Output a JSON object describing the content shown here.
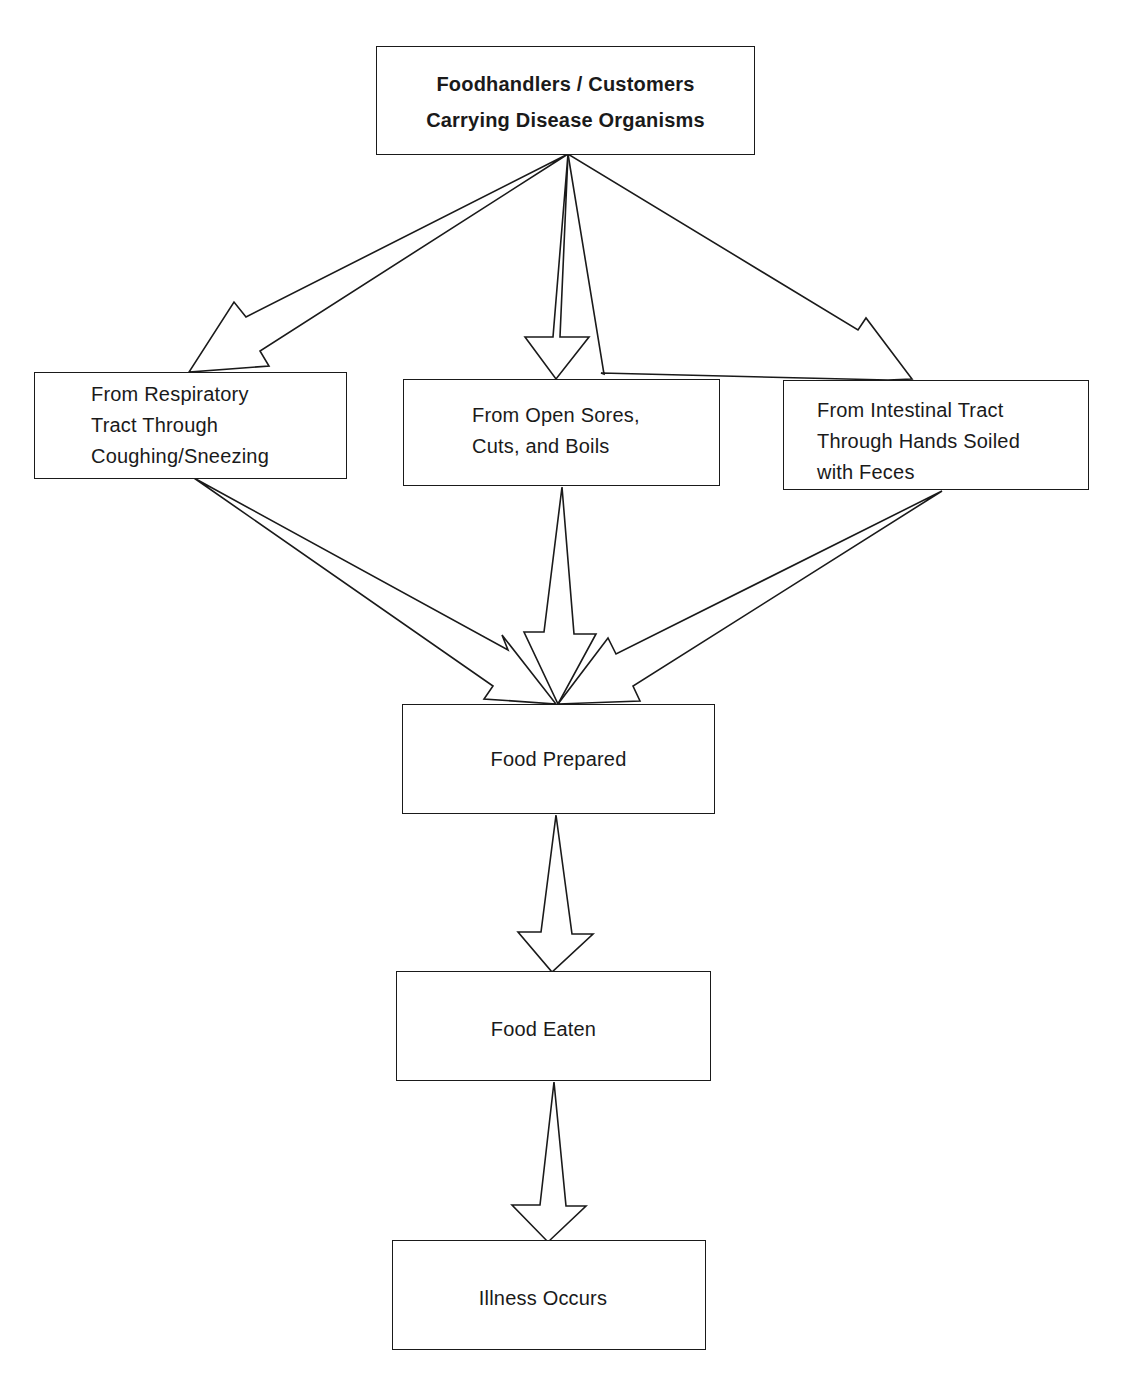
{
  "diagram": {
    "type": "flowchart",
    "nodes": {
      "source": {
        "line1": "Foodhandlers / Customers",
        "line2": "Carrying Disease Organisms"
      },
      "respiratory": {
        "text": "From Respiratory\nTract Through\nCoughing/Sneezing"
      },
      "sores": {
        "text": "From Open Sores,\nCuts, and Boils"
      },
      "intestinal": {
        "text": "From Intestinal Tract\nThrough Hands Soiled\nwith Feces"
      },
      "prepared": {
        "text": "Food Prepared"
      },
      "eaten": {
        "text": "Food Eaten"
      },
      "illness": {
        "text": "Illness Occurs"
      }
    },
    "edges": [
      {
        "from": "source",
        "to": "respiratory"
      },
      {
        "from": "source",
        "to": "sores"
      },
      {
        "from": "source",
        "to": "intestinal"
      },
      {
        "from": "respiratory",
        "to": "prepared"
      },
      {
        "from": "sores",
        "to": "prepared"
      },
      {
        "from": "intestinal",
        "to": "prepared"
      },
      {
        "from": "prepared",
        "to": "eaten"
      },
      {
        "from": "eaten",
        "to": "illness"
      }
    ]
  }
}
